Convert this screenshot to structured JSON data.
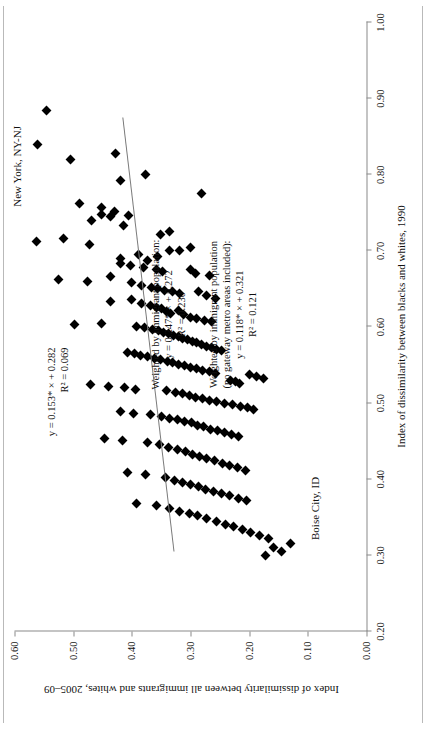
{
  "figure": {
    "point_labels": [
      {
        "text": "New York, NY-NJ",
        "x": 0.885,
        "y": 0.545
      },
      {
        "text": "Boise City, ID",
        "x": 0.315,
        "y": 0.13
      }
    ],
    "annotations": [
      {
        "name": "unweighted-fit",
        "lines": [
          "y = 0.153* × + 0.282",
          "R² = 0.069"
        ],
        "slope": 0.153,
        "intercept": 0.282,
        "r2": 0.069,
        "significance": "*"
      },
      {
        "name": "weighted-fit",
        "lines": [
          "Weighted by immigrant population:",
          "y = 0.247* × + 0.272",
          "R² = 0.230"
        ],
        "slope": 0.247,
        "intercept": 0.272,
        "r2": 0.23,
        "significance": "*"
      },
      {
        "name": "weighted-no-gateway-fit",
        "lines": [
          "Weighted by immigrant population",
          "(no gateway metro areas included):",
          "y = 0.118* × + 0.321",
          "R² = 0.121"
        ],
        "slope": 0.118,
        "intercept": 0.321,
        "r2": 0.121,
        "significance": "*"
      }
    ],
    "colors": {
      "marker": "#000000",
      "trend_line": "#7a7a7a",
      "axis": "#8a8a8a",
      "text": "#111111",
      "page_rule": "#b9b9b9"
    }
  },
  "chart_data": {
    "type": "scatter",
    "title": "",
    "xlabel": "Index of dissimilarity between blacks and whites, 1990",
    "ylabel": "Index of dissimilarity between all immigrants and whites, 2005–09",
    "xlim": [
      0.2,
      1.0
    ],
    "ylim": [
      0.0,
      0.6
    ],
    "xticks": [
      0.2,
      0.3,
      0.4,
      0.5,
      0.6,
      0.7,
      0.8,
      0.9,
      1.0
    ],
    "xticklabels": [
      "0.20",
      "0.30",
      "0.40",
      "0.50",
      "0.60",
      "0.70",
      "0.80",
      "0.90",
      "1.00"
    ],
    "yticks": [
      0.0,
      0.1,
      0.2,
      0.3,
      0.4,
      0.5,
      0.6
    ],
    "yticklabels": [
      "0.00",
      "0.10",
      "0.20",
      "0.30",
      "0.40",
      "0.50",
      "0.60"
    ],
    "grid": false,
    "legend": "none",
    "marker": "diamond",
    "trendline": {
      "slope": 0.153,
      "intercept": 0.282,
      "x_start": 0.305,
      "x_end": 0.875
    },
    "points": [
      [
        0.885,
        0.545
      ],
      [
        0.84,
        0.56
      ],
      [
        0.82,
        0.505
      ],
      [
        0.828,
        0.427
      ],
      [
        0.8,
        0.377
      ],
      [
        0.793,
        0.419
      ],
      [
        0.775,
        0.281
      ],
      [
        0.762,
        0.49
      ],
      [
        0.757,
        0.452
      ],
      [
        0.748,
        0.452
      ],
      [
        0.752,
        0.43
      ],
      [
        0.745,
        0.437
      ],
      [
        0.74,
        0.468
      ],
      [
        0.733,
        0.414
      ],
      [
        0.747,
        0.405
      ],
      [
        0.726,
        0.336
      ],
      [
        0.721,
        0.351
      ],
      [
        0.716,
        0.517
      ],
      [
        0.712,
        0.563
      ],
      [
        0.709,
        0.472
      ],
      [
        0.705,
        0.3
      ],
      [
        0.7,
        0.318
      ],
      [
        0.695,
        0.389
      ],
      [
        0.7,
        0.335
      ],
      [
        0.693,
        0.357
      ],
      [
        0.688,
        0.374
      ],
      [
        0.69,
        0.42
      ],
      [
        0.684,
        0.419
      ],
      [
        0.681,
        0.402
      ],
      [
        0.678,
        0.38
      ],
      [
        0.676,
        0.358
      ],
      [
        0.673,
        0.347
      ],
      [
        0.676,
        0.3
      ],
      [
        0.67,
        0.291
      ],
      [
        0.668,
        0.268
      ],
      [
        0.666,
        0.437
      ],
      [
        0.663,
        0.525
      ],
      [
        0.66,
        0.476
      ],
      [
        0.658,
        0.401
      ],
      [
        0.655,
        0.383
      ],
      [
        0.652,
        0.366
      ],
      [
        0.65,
        0.356
      ],
      [
        0.648,
        0.344
      ],
      [
        0.646,
        0.33
      ],
      [
        0.644,
        0.318
      ],
      [
        0.647,
        0.287
      ],
      [
        0.641,
        0.272
      ],
      [
        0.638,
        0.258
      ],
      [
        0.636,
        0.401
      ],
      [
        0.634,
        0.437
      ],
      [
        0.631,
        0.383
      ],
      [
        0.628,
        0.369
      ],
      [
        0.626,
        0.358
      ],
      [
        0.624,
        0.349
      ],
      [
        0.621,
        0.341
      ],
      [
        0.618,
        0.334
      ],
      [
        0.622,
        0.32
      ],
      [
        0.616,
        0.312
      ],
      [
        0.613,
        0.3
      ],
      [
        0.611,
        0.289
      ],
      [
        0.609,
        0.276
      ],
      [
        0.607,
        0.264
      ],
      [
        0.605,
        0.452
      ],
      [
        0.603,
        0.498
      ],
      [
        0.601,
        0.392
      ],
      [
        0.599,
        0.378
      ],
      [
        0.597,
        0.364
      ],
      [
        0.595,
        0.354
      ],
      [
        0.593,
        0.346
      ],
      [
        0.591,
        0.338
      ],
      [
        0.589,
        0.329
      ],
      [
        0.587,
        0.321
      ],
      [
        0.585,
        0.313
      ],
      [
        0.583,
        0.305
      ],
      [
        0.581,
        0.297
      ],
      [
        0.579,
        0.289
      ],
      [
        0.577,
        0.281
      ],
      [
        0.575,
        0.273
      ],
      [
        0.573,
        0.264
      ],
      [
        0.571,
        0.255
      ],
      [
        0.569,
        0.247
      ],
      [
        0.567,
        0.408
      ],
      [
        0.565,
        0.396
      ],
      [
        0.563,
        0.386
      ],
      [
        0.561,
        0.374
      ],
      [
        0.559,
        0.362
      ],
      [
        0.557,
        0.351
      ],
      [
        0.555,
        0.34
      ],
      [
        0.553,
        0.33
      ],
      [
        0.551,
        0.32
      ],
      [
        0.549,
        0.31
      ],
      [
        0.547,
        0.3
      ],
      [
        0.545,
        0.29
      ],
      [
        0.543,
        0.279
      ],
      [
        0.541,
        0.268
      ],
      [
        0.539,
        0.258
      ],
      [
        0.537,
        0.2
      ],
      [
        0.535,
        0.188
      ],
      [
        0.532,
        0.176
      ],
      [
        0.53,
        0.232
      ],
      [
        0.528,
        0.224
      ],
      [
        0.526,
        0.216
      ],
      [
        0.524,
        0.47
      ],
      [
        0.522,
        0.44
      ],
      [
        0.52,
        0.412
      ],
      [
        0.518,
        0.393
      ],
      [
        0.516,
        0.341
      ],
      [
        0.514,
        0.325
      ],
      [
        0.512,
        0.313
      ],
      [
        0.51,
        0.302
      ],
      [
        0.508,
        0.291
      ],
      [
        0.506,
        0.28
      ],
      [
        0.504,
        0.268
      ],
      [
        0.502,
        0.256
      ],
      [
        0.5,
        0.242
      ],
      [
        0.498,
        0.228
      ],
      [
        0.496,
        0.214
      ],
      [
        0.494,
        0.203
      ],
      [
        0.491,
        0.192
      ],
      [
        0.489,
        0.42
      ],
      [
        0.487,
        0.398
      ],
      [
        0.485,
        0.368
      ],
      [
        0.482,
        0.35
      ],
      [
        0.48,
        0.335
      ],
      [
        0.478,
        0.322
      ],
      [
        0.476,
        0.31
      ],
      [
        0.474,
        0.299
      ],
      [
        0.471,
        0.288
      ],
      [
        0.469,
        0.277
      ],
      [
        0.466,
        0.266
      ],
      [
        0.464,
        0.254
      ],
      [
        0.461,
        0.242
      ],
      [
        0.459,
        0.23
      ],
      [
        0.456,
        0.218
      ],
      [
        0.454,
        0.447
      ],
      [
        0.451,
        0.416
      ],
      [
        0.448,
        0.374
      ],
      [
        0.445,
        0.352
      ],
      [
        0.442,
        0.337
      ],
      [
        0.439,
        0.322
      ],
      [
        0.436,
        0.309
      ],
      [
        0.433,
        0.297
      ],
      [
        0.43,
        0.284
      ],
      [
        0.427,
        0.272
      ],
      [
        0.424,
        0.259
      ],
      [
        0.421,
        0.246
      ],
      [
        0.418,
        0.233
      ],
      [
        0.415,
        0.22
      ],
      [
        0.412,
        0.207
      ],
      [
        0.409,
        0.408
      ],
      [
        0.406,
        0.376
      ],
      [
        0.402,
        0.343
      ],
      [
        0.399,
        0.328
      ],
      [
        0.396,
        0.313
      ],
      [
        0.393,
        0.3
      ],
      [
        0.39,
        0.287
      ],
      [
        0.387,
        0.274
      ],
      [
        0.384,
        0.261
      ],
      [
        0.381,
        0.248
      ],
      [
        0.378,
        0.233
      ],
      [
        0.375,
        0.219
      ],
      [
        0.372,
        0.205
      ],
      [
        0.368,
        0.392
      ],
      [
        0.365,
        0.358
      ],
      [
        0.362,
        0.335
      ],
      [
        0.358,
        0.318
      ],
      [
        0.355,
        0.302
      ],
      [
        0.352,
        0.288
      ],
      [
        0.348,
        0.272
      ],
      [
        0.345,
        0.256
      ],
      [
        0.341,
        0.241
      ],
      [
        0.338,
        0.226
      ],
      [
        0.334,
        0.211
      ],
      [
        0.33,
        0.197
      ],
      [
        0.326,
        0.182
      ],
      [
        0.322,
        0.167
      ],
      [
        0.315,
        0.13
      ],
      [
        0.31,
        0.158
      ],
      [
        0.305,
        0.145
      ],
      [
        0.3,
        0.172
      ]
    ]
  }
}
